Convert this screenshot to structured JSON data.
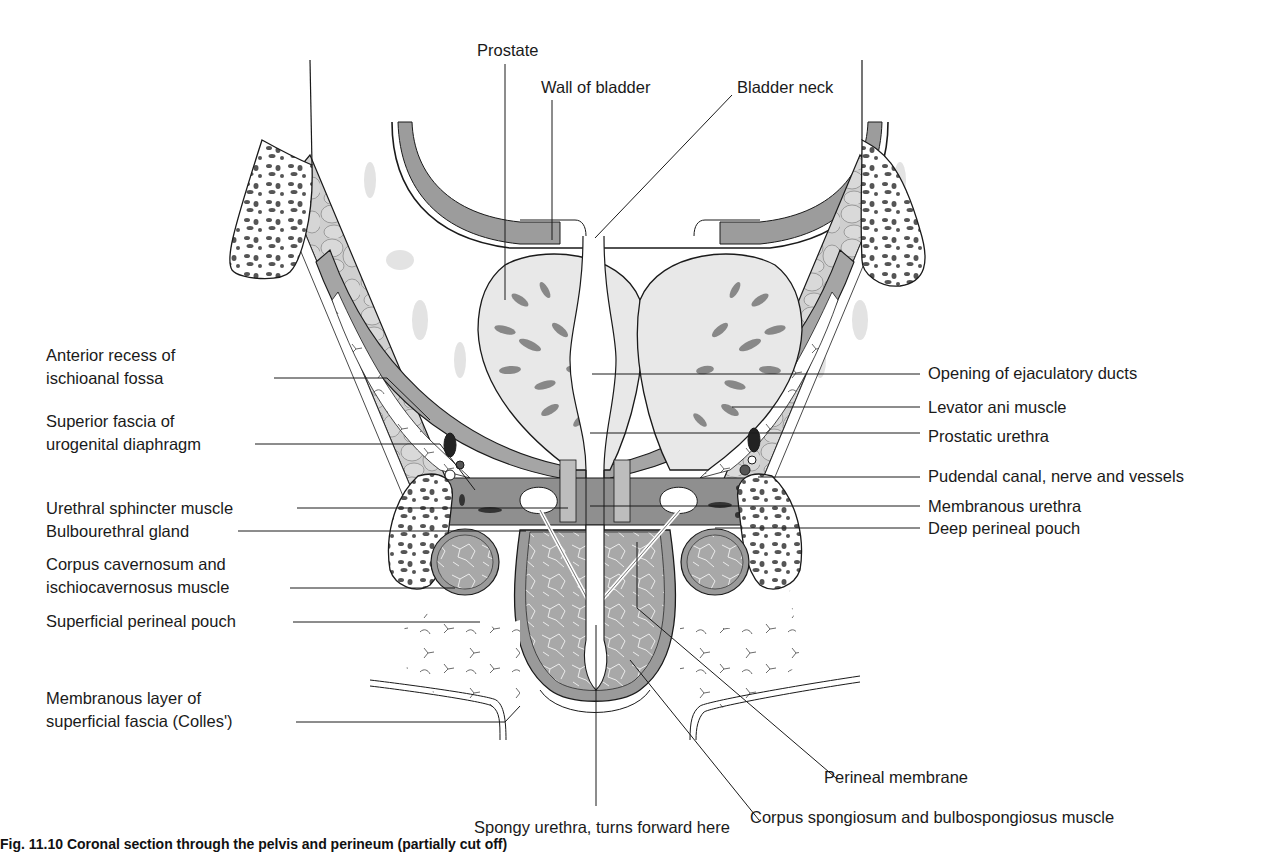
{
  "figure": {
    "caption_visible": "Fig. 11.10   Coronal section through the pelvis and perineum (partially cut off)",
    "colors": {
      "outline": "#1a1a1a",
      "muscle_dark": "#8a8a8a",
      "muscle_mid": "#a9a9a9",
      "fat_light": "#d3d3d3",
      "tissue_pale": "#e6e6e6",
      "bone_spots": "#555555",
      "background": "#ffffff"
    },
    "labels": {
      "top": [
        {
          "id": "prostate",
          "text": "Prostate"
        },
        {
          "id": "wall_of_bladder",
          "text": "Wall of bladder"
        },
        {
          "id": "bladder_neck",
          "text": "Bladder neck"
        }
      ],
      "left": [
        {
          "id": "anterior_recess",
          "line1": "Anterior recess of",
          "line2": "ischioanal fossa"
        },
        {
          "id": "superior_fascia",
          "line1": "Superior fascia of",
          "line2": "urogenital diaphragm"
        },
        {
          "id": "urethral_sphincter",
          "text": "Urethral sphincter muscle"
        },
        {
          "id": "bulbourethral_gland",
          "text": "Bulbourethral gland"
        },
        {
          "id": "corpus_cavernosum",
          "line1": "Corpus cavernosum and",
          "line2": "ischiocavernosus muscle"
        },
        {
          "id": "superficial_perineal_pouch",
          "text": "Superficial perineal pouch"
        },
        {
          "id": "membranous_layer",
          "line1": "Membranous layer of",
          "line2": "superficial fascia (Colles')"
        }
      ],
      "right": [
        {
          "id": "opening_ejaculatory_ducts",
          "text": "Opening of ejaculatory ducts"
        },
        {
          "id": "levator_ani",
          "text": "Levator ani muscle"
        },
        {
          "id": "prostatic_urethra",
          "text": "Prostatic urethra"
        },
        {
          "id": "pudendal_canal",
          "text": "Pudendal canal, nerve and vessels"
        },
        {
          "id": "membranous_urethra",
          "text": "Membranous urethra"
        },
        {
          "id": "deep_perineal_pouch",
          "text": "Deep perineal pouch"
        }
      ],
      "bottom": [
        {
          "id": "perineal_membrane",
          "text": "Perineal membrane"
        },
        {
          "id": "corpus_spongiosum",
          "text": "Corpus spongiosum and bulbospongiosus muscle"
        },
        {
          "id": "spongy_urethra",
          "text": "Spongy urethra, turns forward here"
        }
      ]
    }
  }
}
